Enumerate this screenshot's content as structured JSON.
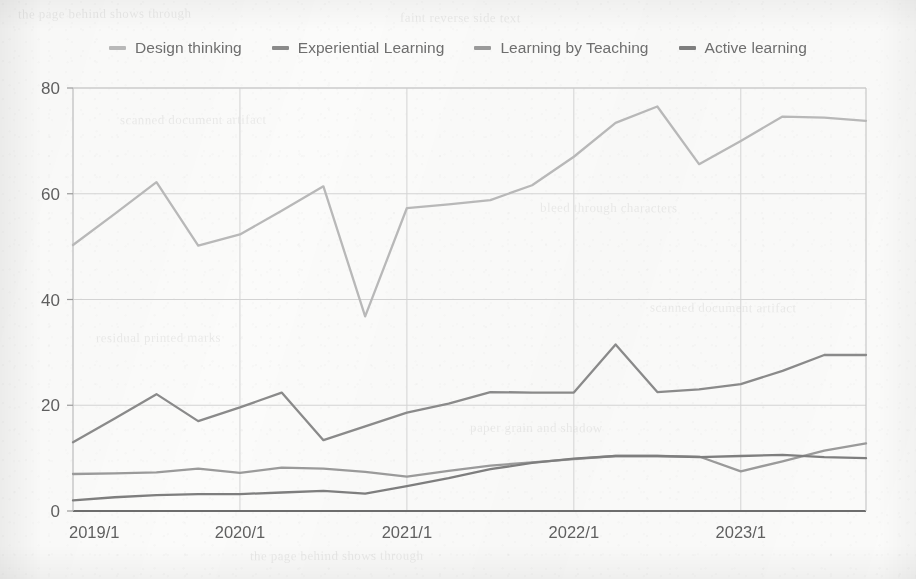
{
  "chart_data": {
    "type": "line",
    "title": "",
    "xlabel": "",
    "ylabel": "",
    "ylim": [
      0,
      80
    ],
    "yticks": [
      0,
      20,
      40,
      60,
      80
    ],
    "xticks": [
      "2019/1",
      "2020/1",
      "2021/1",
      "2022/1",
      "2023/1"
    ],
    "x": [
      "2019/1",
      "2019/2",
      "2019/3",
      "2019/4",
      "2020/1",
      "2020/2",
      "2020/3",
      "2020/4",
      "2021/1",
      "2021/2",
      "2021/3",
      "2021/4",
      "2022/1",
      "2022/2",
      "2022/3",
      "2022/4",
      "2023/1",
      "2023/2",
      "2023/3",
      "2023/4"
    ],
    "grid": true,
    "legend_position": "top",
    "series": [
      {
        "name": "Design thinking",
        "color": "#b8b8b8",
        "values": [
          50.3,
          56.2,
          62.2,
          50.2,
          52.3,
          56.8,
          61.4,
          36.8,
          57.3,
          58.0,
          58.8,
          61.6,
          67.0,
          73.4,
          76.5,
          65.6,
          70.0,
          74.6,
          74.4,
          73.8
        ]
      },
      {
        "name": "Experiential Learning",
        "color": "#8a8a8a",
        "values": [
          13.0,
          17.5,
          22.1,
          17.0,
          19.6,
          22.4,
          13.4,
          16.0,
          18.6,
          20.3,
          22.5,
          22.4,
          22.4,
          31.5,
          22.5,
          23.0,
          24.0,
          26.5,
          29.5,
          29.5
        ]
      },
      {
        "name": "Learning by Teaching",
        "color": "#9a9a9a",
        "values": [
          7.0,
          7.1,
          7.3,
          8.0,
          7.2,
          8.2,
          8.0,
          7.4,
          6.5,
          7.6,
          8.6,
          9.2,
          9.8,
          10.4,
          10.4,
          10.3,
          7.5,
          9.4,
          11.4,
          12.8
        ]
      },
      {
        "name": "Active learning",
        "color": "#7e7e7e",
        "values": [
          2.0,
          2.6,
          3.0,
          3.2,
          3.2,
          3.5,
          3.8,
          3.3,
          4.7,
          6.2,
          7.9,
          9.1,
          9.9,
          10.4,
          10.4,
          10.2,
          10.4,
          10.6,
          10.2,
          10.0
        ]
      }
    ]
  },
  "legend": {
    "items": [
      {
        "label": "Design thinking",
        "color": "#b8b8b8"
      },
      {
        "label": "Experiential Learning",
        "color": "#8a8a8a"
      },
      {
        "label": "Learning by Teaching",
        "color": "#9a9a9a"
      },
      {
        "label": "Active learning",
        "color": "#7e7e7e"
      }
    ]
  },
  "axes": {
    "y_labels": [
      "80",
      "60",
      "40",
      "20",
      "0"
    ],
    "x_labels": [
      "2019/1",
      "2020/1",
      "2021/1",
      "2022/1",
      "2023/1"
    ]
  },
  "background": {
    "ghost_texts": [
      "the page behind shows through",
      "faint reverse side text",
      "scanned document artifact",
      "bleed through characters",
      "residual printed marks",
      "paper grain and shadow"
    ]
  }
}
